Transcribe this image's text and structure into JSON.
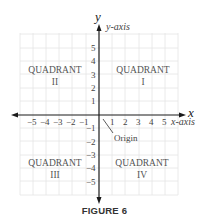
{
  "figure": {
    "caption": "FIGURE 6",
    "axes": {
      "x_var": "x",
      "y_var": "y",
      "x_label": "x-axis",
      "y_label": "y-axis",
      "x_ticks": [
        "−5",
        "−4",
        "−3",
        "−2",
        "−1",
        "1",
        "2",
        "3",
        "4",
        "5"
      ],
      "y_ticks": [
        "5",
        "4",
        "3",
        "2",
        "1",
        "−1",
        "−2",
        "−3",
        "−4",
        "−5"
      ],
      "origin_label": "Origin"
    },
    "quadrants": [
      {
        "name": "QUADRANT",
        "numeral": "I"
      },
      {
        "name": "QUADRANT",
        "numeral": "II"
      },
      {
        "name": "QUADRANT",
        "numeral": "III"
      },
      {
        "name": "QUADRANT",
        "numeral": "IV"
      }
    ],
    "colors": {
      "grid": "#e2e2e2",
      "axis": "#1a1a1a",
      "text": "#555555"
    }
  }
}
